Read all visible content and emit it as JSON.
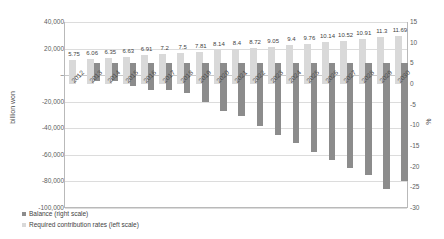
{
  "chart_data": {
    "type": "bar",
    "title": "",
    "subtitle": "",
    "xlabel": "",
    "ylabel": "billion won",
    "y2label": "%",
    "ylim": [
      -100000,
      40000
    ],
    "y2lim": [
      -30,
      15
    ],
    "grid": true,
    "legend_position": "bottom-left-inside",
    "categories": [
      "2012",
      "2013",
      "2014",
      "2015",
      "2016",
      "2017",
      "2018",
      "2019",
      "2020",
      "2021",
      "2022",
      "2023",
      "2024",
      "2025",
      "2026",
      "2027",
      "2028",
      "2029",
      "2030"
    ],
    "yticks": [
      "40,000",
      "20,000",
      "–",
      "-20,000",
      "-40,000",
      "-60,000",
      "-80,000",
      "-100,000"
    ],
    "ytick_values": [
      40000,
      20000,
      0,
      -20000,
      -40000,
      -60000,
      -80000,
      -100000
    ],
    "y2ticks": [
      "15",
      "10",
      "5",
      "0",
      "-5",
      "-10",
      "-15",
      "-20",
      "-25",
      "-30"
    ],
    "y2tick_values": [
      15,
      10,
      5,
      0,
      -5,
      -10,
      -15,
      -20,
      -25,
      -30
    ],
    "series": [
      {
        "name": "Required contribution rates (left scale)",
        "axis": "right",
        "color": "#d9d9d9",
        "unit": "%",
        "values": [
          5.75,
          6.06,
          6.35,
          6.63,
          6.91,
          7.2,
          7.5,
          7.81,
          8.14,
          8.4,
          8.72,
          9.05,
          9.4,
          9.76,
          10.14,
          10.52,
          10.91,
          11.3,
          11.69
        ],
        "labels": [
          "5.75",
          "6.06",
          "6.35",
          "6.63",
          "6.91",
          "7.2",
          "7.5",
          "7.81",
          "8.14",
          "8.4",
          "8.72",
          "9.05",
          "9.4",
          "9.76",
          "10.14",
          "10.52",
          "10.91",
          "11.3",
          "11.69"
        ]
      },
      {
        "name": "Balance (right scale)",
        "axis": "left",
        "color": "#8c8c8c",
        "unit": "billion won",
        "values": [
          0,
          -4500,
          -4700,
          -8200,
          -11000,
          -11500,
          -13500,
          -20500,
          -27000,
          -31000,
          -38500,
          -45000,
          -51000,
          -58000,
          -63500,
          -70000,
          -75500,
          -85500,
          -80000
        ]
      }
    ]
  },
  "legend": {
    "items": [
      {
        "label": "Balance (right scale)",
        "color": "#8c8c8c"
      },
      {
        "label": "Required contribution rates (left scale)",
        "color": "#d9d9d9"
      }
    ]
  }
}
